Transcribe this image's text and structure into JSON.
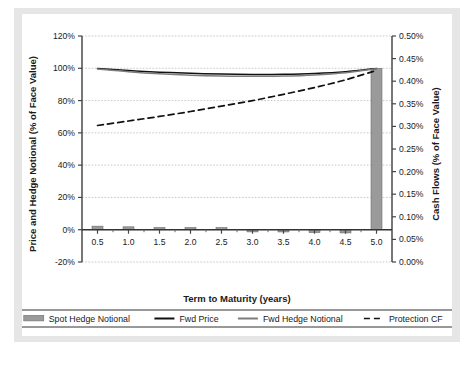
{
  "figure": {
    "background_color": "#ffffff",
    "paper_color": "#e6e6e6",
    "caption": ""
  },
  "chart_data": {
    "type": "line",
    "title": "",
    "subtitle": "",
    "xlabel": "Term to Maturity (years)",
    "ylabel": "Price and Hedge Notional (% of Face Value)",
    "y2label": "Cash Flows (% of Face Value)",
    "grid": true,
    "legend_position": "bottom",
    "x": [
      0.5,
      1.0,
      1.5,
      2.0,
      2.5,
      3.0,
      3.5,
      4.0,
      4.5,
      5.0
    ],
    "xlim": [
      0.25,
      5.25
    ],
    "xticks": [
      0.5,
      1.0,
      1.5,
      2.0,
      2.5,
      3.0,
      3.5,
      4.0,
      4.5,
      5.0
    ],
    "xticklabels": [
      "0.5",
      "1.0",
      "1.5",
      "2.0",
      "2.5",
      "3.0",
      "3.5",
      "4.0",
      "4.5",
      "5.0"
    ],
    "ylim": [
      -20,
      120
    ],
    "yticks": [
      -20,
      0,
      20,
      40,
      60,
      80,
      100,
      120
    ],
    "yticklabels": [
      "-20%",
      "0%",
      "20%",
      "40%",
      "60%",
      "80%",
      "100%",
      "120%"
    ],
    "y2lim": [
      0.0,
      0.5
    ],
    "y2ticks": [
      0.0,
      0.05,
      0.1,
      0.15,
      0.2,
      0.25,
      0.3,
      0.35,
      0.4,
      0.45,
      0.5
    ],
    "y2ticklabels": [
      "0.00%",
      "0.05%",
      "0.10%",
      "0.15%",
      "0.20%",
      "0.25%",
      "0.30%",
      "0.35%",
      "0.40%",
      "0.45%",
      "0.50%"
    ],
    "series": [
      {
        "name": "Spot Hedge Notional",
        "type": "bar",
        "axis": "left",
        "color": "#9a9a9a",
        "edge_color": "#6e6e6e",
        "values": [
          2.2,
          1.8,
          1.2,
          0.0,
          0.0,
          -0.9,
          -1.4,
          -1.8,
          -2.0,
          100.0
        ]
      },
      {
        "name": "Fwd Price",
        "type": "line",
        "axis": "left",
        "color": "#111111",
        "dash": "solid",
        "values": [
          99.8,
          98.6,
          97.6,
          96.9,
          96.4,
          96.2,
          96.3,
          96.8,
          97.9,
          99.9
        ]
      },
      {
        "name": "Fwd Hedge Notional",
        "type": "line",
        "axis": "left",
        "color": "#7d7d7d",
        "dash": "solid",
        "values": [
          99.6,
          97.9,
          96.6,
          95.7,
          95.2,
          95.0,
          95.2,
          95.9,
          97.3,
          99.7
        ]
      },
      {
        "name": "Protection CF",
        "type": "line",
        "axis": "right",
        "color": "#111111",
        "dash": "dashed",
        "values": [
          0.302,
          0.312,
          0.322,
          0.333,
          0.345,
          0.357,
          0.371,
          0.386,
          0.403,
          0.424
        ]
      }
    ],
    "legend": [
      {
        "label": "Spot Hedge Notional",
        "marker": "bar",
        "color": "#9a9a9a"
      },
      {
        "label": "Fwd Price",
        "marker": "line-solid",
        "color": "#111111"
      },
      {
        "label": "Fwd Hedge Notional",
        "marker": "line-solid",
        "color": "#7d7d7d"
      },
      {
        "label": "Protection CF",
        "marker": "line-dashed",
        "color": "#111111"
      }
    ]
  }
}
